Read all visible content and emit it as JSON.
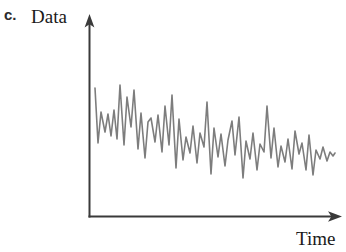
{
  "figure": {
    "panel_letter": "c.",
    "y_axis_label": "Data",
    "x_axis_label": "Time",
    "axis_color": "#3a3a3a",
    "series_color": "#7d7d7d",
    "background_color": "#ffffff",
    "text_color": "#1a1a1a"
  },
  "chart_data": {
    "type": "line",
    "title": "",
    "subtitle": "",
    "xlabel": "Time",
    "ylabel": "Data",
    "panel": "c.",
    "grid": false,
    "legend": null,
    "axes": {
      "x_origin_px": 89,
      "y_origin_px": 217,
      "x_end_px": 341,
      "y_top_px": 16,
      "arrowheads": [
        "x-axis-right",
        "y-axis-top"
      ],
      "tick_labels_x": [],
      "tick_labels_y": [],
      "xlim": [
        0,
        100
      ],
      "ylim": [
        0,
        100
      ]
    },
    "trend": "decreasing",
    "x": [
      0,
      1.2,
      2.4,
      3.6,
      4.8,
      6.0,
      7.2,
      8.4,
      9.6,
      10.8,
      12.0,
      13.2,
      14.4,
      15.6,
      16.8,
      18.0,
      19.2,
      20.4,
      21.6,
      22.8,
      24.0,
      25.2,
      26.4,
      27.6,
      28.8,
      30.0,
      31.2,
      32.4,
      33.6,
      34.8,
      36.0,
      37.2,
      38.4,
      39.6,
      40.8,
      42.0,
      43.2,
      44.4,
      45.6,
      46.8,
      48.0,
      49.2,
      50.4,
      51.6,
      52.8,
      54.0,
      55.2,
      56.4,
      57.6,
      58.8,
      60.0,
      61.2,
      62.4,
      63.6,
      64.8,
      66.0,
      67.2,
      68.4,
      69.6,
      70.8,
      72.0,
      73.2,
      74.4,
      75.6,
      76.8,
      78.0,
      79.2,
      80.4,
      81.6,
      82.8,
      84.0,
      85.2,
      86.4,
      87.6,
      88.8,
      90.0,
      91.2,
      92.4,
      93.6,
      94.8,
      96.0,
      97.2,
      98.4,
      100.0
    ],
    "y": [
      74,
      47,
      62,
      50,
      59,
      48,
      61,
      46,
      78,
      44,
      70,
      53,
      75,
      43,
      60,
      38,
      55,
      57,
      45,
      58,
      40,
      63,
      43,
      71,
      30,
      56,
      35,
      48,
      38,
      52,
      33,
      47,
      40,
      66,
      27,
      50,
      36,
      48,
      29,
      44,
      51,
      35,
      54,
      22,
      41,
      32,
      45,
      26,
      40,
      34,
      63,
      30,
      47,
      25,
      39,
      28,
      42,
      24,
      45,
      31,
      37,
      22,
      43,
      19,
      35,
      29,
      38,
      26,
      33,
      23,
      36,
      28,
      31,
      25,
      30,
      27,
      29,
      26,
      28,
      25,
      27,
      26,
      27,
      26
    ],
    "series": [
      {
        "name": "Data",
        "color": "#7d7d7d",
        "style": "solid",
        "marker": "none",
        "line_width_px": 1.6
      }
    ],
    "polyline_px": "95,88 98,143 101,112 105,132 108,114 111,136 114,110 117,139 120,85 124,145 127,97 131,127 134,90 138,149 141,113 145,158 148,122 151,118 155,142 158,115 162,152 165,106 169,145 172,95 176,168 179,119 183,160 186,137 190,153 193,126 197,163 200,133 204,147 207,102 211,174 214,128 218,157 221,134 225,166 228,140 232,121 235,155 239,117 243,178 246,141 250,159 253,133 257,170 260,144 264,152 267,106 271,158 274,128 278,167 281,146 285,162 288,139 292,169 295,131 299,154 302,143 306,170 309,135 313,175 316,150 320,159 323,147 327,161 330,152 333,156 335,153",
    "notes": [
      "Values in 'y' are unitless percentages of the plotted vertical range (no tick labels are shown in the figure).",
      "polyline_px lists the traced vertex coordinates in screenshot pixel space."
    ]
  }
}
